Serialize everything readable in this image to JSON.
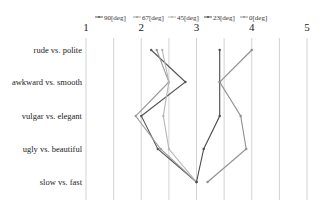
{
  "chart_data": {
    "type": "line",
    "orientation": "horizontal-profile",
    "title": "",
    "xlabel": "",
    "ylabel": "",
    "xlim": [
      1,
      5
    ],
    "x_ticks": [
      "1",
      "2",
      "3",
      "4",
      "5"
    ],
    "grid": true,
    "legend_position": "top",
    "categories": [
      "rude vs. polite",
      "awkward vs. smooth",
      "vulgar vs. elegant",
      "ugly vs. beautiful",
      "slow vs. fast"
    ],
    "series": [
      {
        "name": "90[deg]",
        "color": "#555555",
        "values": [
          2.18,
          2.8,
          2.0,
          2.3,
          3.0
        ]
      },
      {
        "name": "67[deg]",
        "color": "#9a9a9a",
        "values": [
          2.28,
          2.5,
          1.9,
          2.35,
          3.0
        ]
      },
      {
        "name": "45[deg]",
        "color": "#b5b5b5",
        "values": [
          2.38,
          2.5,
          2.4,
          2.5,
          3.0
        ]
      },
      {
        "name": "23[deg]",
        "color": "#4a4a4a",
        "values": [
          3.42,
          3.42,
          3.42,
          3.13,
          3.0
        ]
      },
      {
        "name": "0[deg]",
        "color": "#8f8f8f",
        "values": [
          4.0,
          3.42,
          3.8,
          3.9,
          3.2
        ]
      }
    ]
  }
}
